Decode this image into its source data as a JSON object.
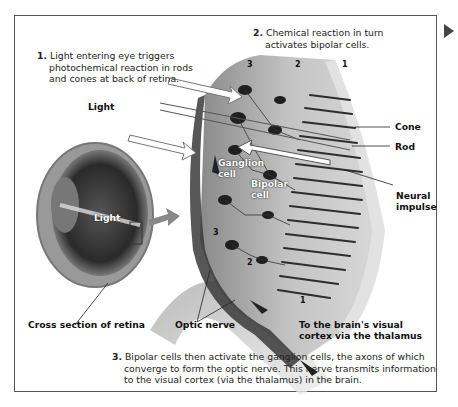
{
  "steps": [
    {
      "number": "1.",
      "lines": [
        "Light entering eye triggers",
        "photochemical reaction in rods",
        "and cones at back of retina."
      ]
    },
    {
      "number": "2.",
      "lines": [
        "Chemical reaction in turn",
        "activates bipolar cells."
      ]
    },
    {
      "number": "3.",
      "lines": [
        "Bipolar cells then activate the ganglion cells, the axons of which",
        "converge to form the optic nerve. This nerve transmits information",
        "to the visual cortex (via the thalamus) in the brain."
      ]
    }
  ],
  "labels": {
    "light_top": "Light",
    "light_eye": "Light",
    "cone": "Cone",
    "rod": "Rod",
    "neural_impulse_1": "Neural",
    "neural_impulse_2": "impulse",
    "ganglion_cell_1": "Ganglion",
    "ganglion_cell_2": "cell",
    "bipolar_cell_1": "Bipolar",
    "bipolar_cell_2": "cell",
    "cross_section": "Cross section of retina",
    "optic_nerve": "Optic nerve",
    "brain_1": "To the brain's visual",
    "brain_2": "cortex via the thalamus"
  },
  "layer_numbers_top": [
    "3",
    "2",
    "1"
  ],
  "layer_numbers_side": [
    "3",
    "2",
    "1"
  ],
  "colors": {
    "frame": "#555555",
    "tissue": "#b8b8b8",
    "dark": "#2a2a2a",
    "arrow": "#888888"
  }
}
